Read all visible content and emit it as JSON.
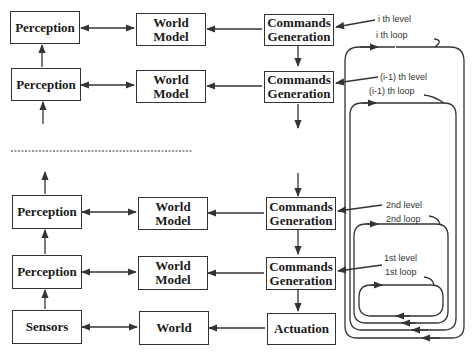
{
  "diagram": {
    "levels": [
      {
        "id": "i",
        "perception": "Perception",
        "world_model_line1": "World",
        "world_model_line2": "Model",
        "commands_line1": "Commands",
        "commands_line2": "Generation",
        "level_label": "i th level",
        "loop_label": "i th loop"
      },
      {
        "id": "i-1",
        "perception": "Perception",
        "world_model_line1": "World",
        "world_model_line2": "Model",
        "commands_line1": "Commands",
        "commands_line2": "Generation",
        "level_label": "(i-1) th level",
        "loop_label": "(i-1) th loop"
      },
      {
        "id": "2",
        "perception": "Perception",
        "world_model_line1": "World",
        "world_model_line2": "Model",
        "commands_line1": "Commands",
        "commands_line2": "Generation",
        "level_label": "2nd level",
        "loop_label": "2nd loop"
      },
      {
        "id": "1",
        "perception": "Perception",
        "world_model_line1": "World",
        "world_model_line2": "Model",
        "commands_line1": "Commands",
        "commands_line2": "Generation",
        "level_label": "1st level",
        "loop_label": "1st loop"
      }
    ],
    "base": {
      "sensors": "Sensors",
      "world": "World",
      "actuation": "Actuation"
    },
    "colors": {
      "line": "#333333",
      "box_border": "#333333",
      "text": "#1a1a1a",
      "background": "#ffffff"
    }
  }
}
